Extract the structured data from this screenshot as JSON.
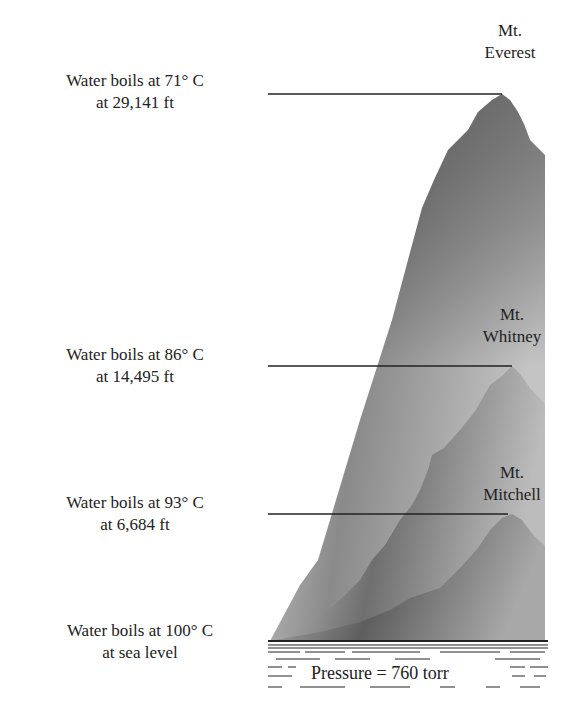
{
  "figure": {
    "levels": [
      {
        "peak": "Mt. Everest",
        "peak_line1": "Mt.",
        "peak_line2": "Everest",
        "line1": "Water boils at 71° C",
        "line2": "at 29,141 ft",
        "boiling_point_c": 71,
        "altitude_ft": 29141
      },
      {
        "peak": "Mt. Whitney",
        "peak_line1": "Mt.",
        "peak_line2": "Whitney",
        "line1": "Water boils at 86° C",
        "line2": "at 14,495 ft",
        "boiling_point_c": 86,
        "altitude_ft": 14495
      },
      {
        "peak": "Mt. Mitchell",
        "peak_line1": "Mt.",
        "peak_line2": "Mitchell",
        "line1": "Water boils at 93° C",
        "line2": "at 6,684 ft",
        "boiling_point_c": 93,
        "altitude_ft": 6684
      },
      {
        "peak": "Sea level",
        "line1": "Water boils at 100° C",
        "line2": "at sea level",
        "boiling_point_c": 100,
        "altitude_ft": 0
      }
    ],
    "sea": {
      "label": "Pressure = 760 torr"
    }
  }
}
